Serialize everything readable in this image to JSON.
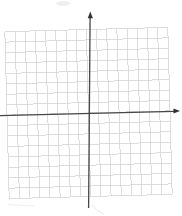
{
  "figure": {
    "background": "#ffffff",
    "width": 182,
    "height": 216,
    "grid": {
      "cols": 16,
      "rows": 16,
      "left": 7,
      "top": 29.5,
      "right": 170,
      "bottom": 196.5,
      "rotation_deg": -1.5,
      "rotation_cx": 88.5,
      "rotation_cy": 113,
      "line_color": "#d2d2d2",
      "line_width": 0.75
    },
    "axes": {
      "color": "#474747",
      "line_width": 1.3,
      "arrow_color": "#333333",
      "x_axis": {
        "x1": 0,
        "y1": 115.7,
        "x2": 174,
        "y2": 111.3
      },
      "x_arrow": {
        "tip_x": 180,
        "tip_y": 111.1,
        "back_x": 173.5,
        "half_width": 2.5
      },
      "y_axis": {
        "x1": 88.6,
        "y1": 208,
        "x2": 90.1,
        "y2": 17
      },
      "y_arrow": {
        "tip_x": 90.3,
        "tip_y": 11.5,
        "back_y": 18.2,
        "half_width": 2.6
      }
    },
    "artifacts": {
      "color": "#c9c9c9",
      "top_smudge": {
        "x": 56,
        "y": 1,
        "w": 14,
        "h": 5,
        "opacity": 0.3
      },
      "bottom_curl_path": "M 92,205 Q 97,211 104,214",
      "bottom_left_mark": {
        "x1": 8,
        "y1": 204.5,
        "x2": 34,
        "y2": 206,
        "opacity": 0.45
      }
    }
  },
  "chart_data": {
    "type": "scatter",
    "title": "",
    "xlabel": "",
    "ylabel": "",
    "series": [],
    "xlim": [
      -8,
      8
    ],
    "ylim": [
      -8,
      8
    ],
    "grid": true,
    "grid_spacing": 1,
    "tick_labels": "none",
    "axes_arrows": [
      "x-positive",
      "y-positive"
    ]
  }
}
